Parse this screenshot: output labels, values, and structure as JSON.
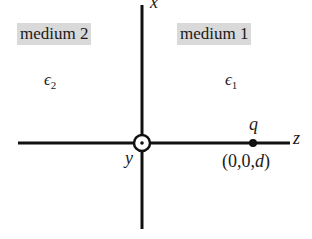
{
  "diagram": {
    "regions": [
      {
        "label": "medium 2",
        "permittivity": "ϵ",
        "subscript": "2"
      },
      {
        "label": "medium 1",
        "permittivity": "ϵ",
        "subscript": "1"
      }
    ],
    "axes": {
      "x_label": "x",
      "y_label": "y",
      "z_label": "z"
    },
    "charge": {
      "label": "q",
      "coord_open": "(0,0,",
      "coord_var": "d",
      "coord_close": ")"
    },
    "colors": {
      "line": "#111111",
      "medium_bg": "#d9d9d9"
    }
  }
}
